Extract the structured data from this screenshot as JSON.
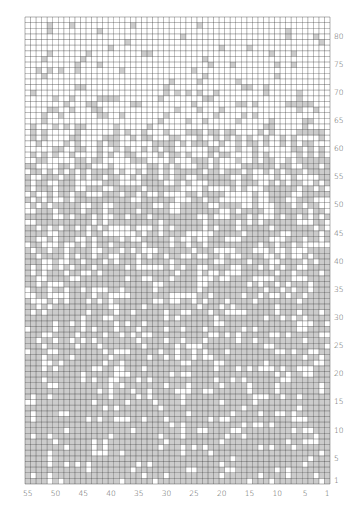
{
  "chart_data": {
    "type": "heatmap",
    "title": "",
    "columns": 55,
    "rows": 83,
    "x_tick_labels": [
      "55",
      "50",
      "45",
      "40",
      "35",
      "30",
      "25",
      "20",
      "15",
      "10",
      "5",
      "1"
    ],
    "x_tick_values": [
      55,
      50,
      45,
      40,
      35,
      30,
      25,
      20,
      15,
      10,
      5,
      1
    ],
    "y_tick_labels": [
      "80",
      "75",
      "70",
      "65",
      "60",
      "55",
      "50",
      "45",
      "40",
      "35",
      "30",
      "25",
      "20",
      "15",
      "10",
      "5",
      "1"
    ],
    "y_tick_values": [
      80,
      75,
      70,
      65,
      60,
      55,
      50,
      45,
      40,
      35,
      30,
      25,
      20,
      15,
      10,
      5,
      1
    ],
    "x_direction": "right-to-left",
    "y_direction": "bottom-to-top",
    "grey_density_by_row_band": [
      {
        "rows": [
          1,
          10
        ],
        "grey_fraction": 0.85
      },
      {
        "rows": [
          11,
          20
        ],
        "grey_fraction": 0.82
      },
      {
        "rows": [
          21,
          30
        ],
        "grey_fraction": 0.78
      },
      {
        "rows": [
          31,
          40
        ],
        "grey_fraction": 0.72
      },
      {
        "rows": [
          41,
          50
        ],
        "grey_fraction": 0.66
      },
      {
        "rows": [
          51,
          58
        ],
        "grey_fraction": 0.55
      },
      {
        "rows": [
          59,
          63
        ],
        "grey_fraction": 0.35
      },
      {
        "rows": [
          64,
          68
        ],
        "grey_fraction": 0.2
      },
      {
        "rows": [
          69,
          75
        ],
        "grey_fraction": 0.1
      },
      {
        "rows": [
          76,
          83
        ],
        "grey_fraction": 0.06
      }
    ],
    "colors": {
      "grey_cell": "#cccccc",
      "white_cell": "#ffffff",
      "grid_line": "#333333",
      "label": "#555555"
    },
    "grid": true,
    "legend": "none"
  },
  "layout": {
    "grid_left": 25,
    "grid_top": 17,
    "grid_right": 330,
    "grid_bottom": 484
  }
}
